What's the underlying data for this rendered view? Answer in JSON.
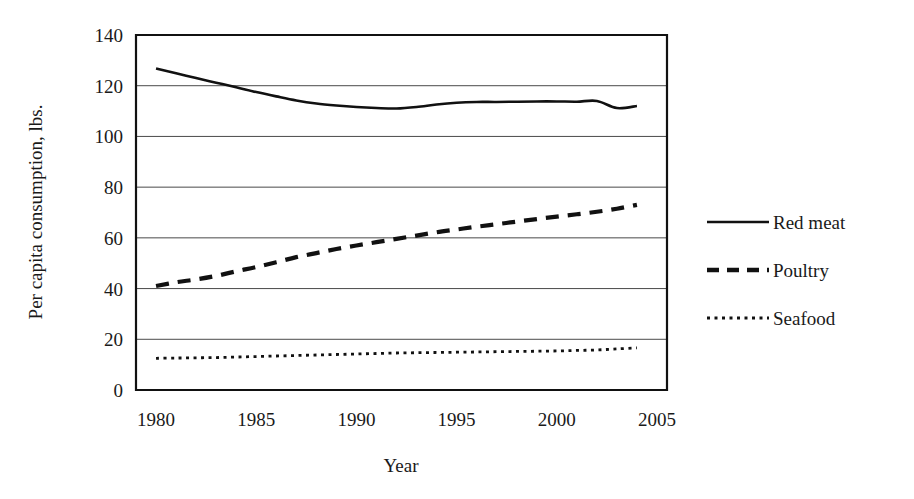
{
  "chart_data": {
    "type": "line",
    "title": "",
    "xlabel": "Year",
    "ylabel": "Per capita consumption, lbs.",
    "xlim": [
      1979,
      2005.5
    ],
    "ylim": [
      0,
      140
    ],
    "xticks": [
      "1980",
      "1985",
      "1990",
      "1995",
      "2000",
      "2005"
    ],
    "xtick_values": [
      1980,
      1985,
      1990,
      1995,
      2000,
      2005
    ],
    "yticks": [
      "0",
      "20",
      "40",
      "60",
      "80",
      "100",
      "120",
      "140"
    ],
    "ytick_values": [
      0,
      20,
      40,
      60,
      80,
      100,
      120,
      140
    ],
    "grid": "horizontal",
    "legend_position": "right",
    "x": [
      1980,
      1981,
      1982,
      1983,
      1984,
      1985,
      1986,
      1987,
      1988,
      1989,
      1990,
      1991,
      1992,
      1993,
      1994,
      1995,
      1996,
      1997,
      1998,
      1999,
      2000,
      2001,
      2002,
      2003,
      2004
    ],
    "series": [
      {
        "name": "Red meat",
        "style": "solid",
        "color": "#111111",
        "values": [
          126.8,
          124.9,
          123.0,
          121.2,
          119.4,
          117.5,
          115.8,
          114.2,
          113.0,
          112.2,
          111.6,
          111.2,
          111.0,
          111.6,
          112.6,
          113.3,
          113.6,
          113.6,
          113.7,
          113.8,
          113.8,
          113.7,
          114.0,
          111.2,
          112.0
        ]
      },
      {
        "name": "Poultry",
        "style": "dashed",
        "color": "#111111",
        "values": [
          41.0,
          42.5,
          43.6,
          45.0,
          46.8,
          48.5,
          50.4,
          52.4,
          54.0,
          55.6,
          57.0,
          58.3,
          59.6,
          60.9,
          62.2,
          63.3,
          64.4,
          65.4,
          66.4,
          67.4,
          68.4,
          69.3,
          70.3,
          71.5,
          73.0
        ]
      },
      {
        "name": "Seafood",
        "style": "dotted",
        "color": "#111111",
        "values": [
          12.5,
          12.6,
          12.7,
          12.8,
          13.0,
          13.2,
          13.4,
          13.6,
          13.8,
          14.0,
          14.2,
          14.4,
          14.6,
          14.7,
          14.8,
          14.9,
          15.0,
          15.1,
          15.2,
          15.3,
          15.4,
          15.6,
          15.8,
          16.2,
          16.6
        ]
      }
    ]
  },
  "legend": {
    "items": [
      {
        "label": "Red meat",
        "style": "solid"
      },
      {
        "label": "Poultry",
        "style": "dashed"
      },
      {
        "label": "Seafood",
        "style": "dotted"
      }
    ]
  }
}
